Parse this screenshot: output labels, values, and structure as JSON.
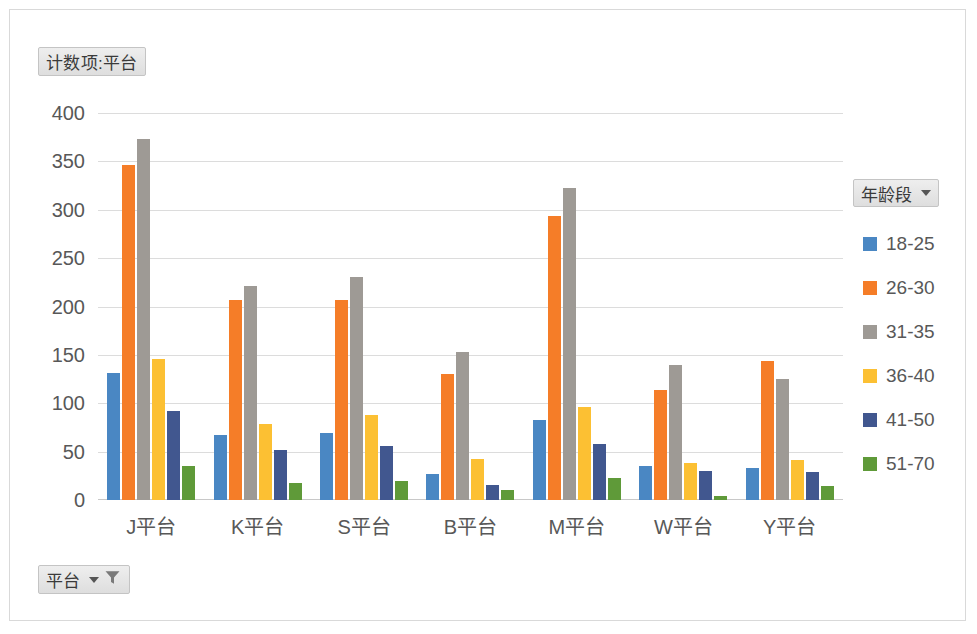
{
  "chart_data": {
    "type": "bar",
    "title": "计数项:平台",
    "xlabel": "平台",
    "ylabel": "",
    "ylim": [
      0,
      400
    ],
    "ytick_step": 50,
    "yticks": [
      400,
      350,
      300,
      250,
      200,
      150,
      100,
      50,
      0
    ],
    "grid": true,
    "legend_position": "right",
    "legend_title": "年龄段",
    "categories": [
      "J平台",
      "K平台",
      "S平台",
      "B平台",
      "M平台",
      "W平台",
      "Y平台"
    ],
    "series": [
      {
        "name": "18-25",
        "color": "#4a87c3",
        "values": [
          131,
          67,
          69,
          27,
          83,
          35,
          33
        ]
      },
      {
        "name": "26-30",
        "color": "#f57d28",
        "values": [
          346,
          207,
          207,
          130,
          294,
          114,
          144
        ]
      },
      {
        "name": "31-35",
        "color": "#9e9a95",
        "values": [
          373,
          221,
          231,
          153,
          323,
          140,
          125
        ]
      },
      {
        "name": "36-40",
        "color": "#fcc033",
        "values": [
          146,
          79,
          88,
          42,
          96,
          38,
          41
        ]
      },
      {
        "name": "41-50",
        "color": "#41578f",
        "values": [
          92,
          52,
          56,
          16,
          58,
          30,
          29
        ]
      },
      {
        "name": "51-70",
        "color": "#5f9a39",
        "values": [
          35,
          18,
          20,
          10,
          23,
          4,
          15
        ]
      }
    ]
  },
  "pivot_buttons": {
    "count_field": "计数项:平台",
    "legend_field": "年龄段",
    "platform_filter": "平台"
  },
  "icons": {
    "caret": "chevron-down-icon",
    "funnel": "filter-funnel-icon"
  }
}
